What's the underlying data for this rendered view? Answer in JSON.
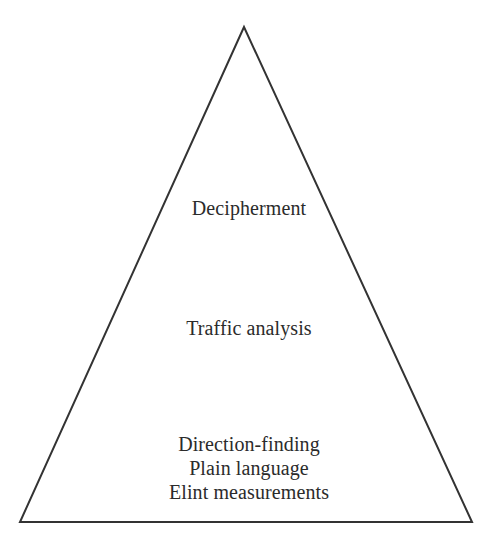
{
  "diagram": {
    "type": "pyramid",
    "shape": {
      "apex": [
        244,
        27
      ],
      "bottom_left": [
        20,
        522
      ],
      "bottom_right": [
        472,
        522
      ],
      "stroke_color": "#333333",
      "stroke_width": 2
    },
    "levels": [
      {
        "label": "Decipherment",
        "position": "top"
      },
      {
        "label": "Traffic analysis",
        "position": "middle"
      },
      {
        "position": "bottom",
        "lines": [
          "Direction-finding",
          "Plain language",
          "Elint measurements"
        ]
      }
    ]
  }
}
